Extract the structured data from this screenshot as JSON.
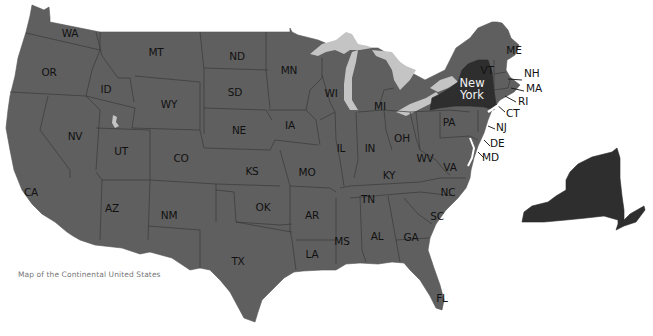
{
  "caption": "Map of the Continental United States",
  "colors": {
    "land": "#5f5f5f",
    "highlight_new_york": "#2e2e2e",
    "lakes": "#c4c4c4",
    "label_text": "#111111",
    "highlight_label_text": "#f2f2f2",
    "caption_text": "#777777",
    "background": "#ffffff"
  },
  "highlighted_state": {
    "line1": "New",
    "line2": "York"
  },
  "states": [
    {
      "abbr": "WA",
      "x": 70,
      "y": 33
    },
    {
      "abbr": "OR",
      "x": 49,
      "y": 72
    },
    {
      "abbr": "ID",
      "x": 106,
      "y": 89
    },
    {
      "abbr": "MT",
      "x": 156,
      "y": 52
    },
    {
      "abbr": "WY",
      "x": 169,
      "y": 104
    },
    {
      "abbr": "ND",
      "x": 237,
      "y": 56
    },
    {
      "abbr": "SD",
      "x": 235,
      "y": 92
    },
    {
      "abbr": "NE",
      "x": 239,
      "y": 130
    },
    {
      "abbr": "MN",
      "x": 289,
      "y": 70
    },
    {
      "abbr": "IA",
      "x": 290,
      "y": 125
    },
    {
      "abbr": "WI",
      "x": 331,
      "y": 93
    },
    {
      "abbr": "MI",
      "x": 380,
      "y": 106
    },
    {
      "abbr": "NV",
      "x": 75,
      "y": 136
    },
    {
      "abbr": "UT",
      "x": 121,
      "y": 151
    },
    {
      "abbr": "CO",
      "x": 181,
      "y": 158
    },
    {
      "abbr": "KS",
      "x": 252,
      "y": 171
    },
    {
      "abbr": "MO",
      "x": 307,
      "y": 172
    },
    {
      "abbr": "IL",
      "x": 341,
      "y": 148
    },
    {
      "abbr": "IN",
      "x": 370,
      "y": 148
    },
    {
      "abbr": "OH",
      "x": 402,
      "y": 138
    },
    {
      "abbr": "PA",
      "x": 449,
      "y": 122
    },
    {
      "abbr": "WV",
      "x": 425,
      "y": 158
    },
    {
      "abbr": "VA",
      "x": 450,
      "y": 167
    },
    {
      "abbr": "KY",
      "x": 389,
      "y": 175
    },
    {
      "abbr": "CA",
      "x": 31,
      "y": 192
    },
    {
      "abbr": "AZ",
      "x": 112,
      "y": 208
    },
    {
      "abbr": "NM",
      "x": 169,
      "y": 215
    },
    {
      "abbr": "OK",
      "x": 263,
      "y": 207
    },
    {
      "abbr": "AR",
      "x": 312,
      "y": 215
    },
    {
      "abbr": "TN",
      "x": 368,
      "y": 199
    },
    {
      "abbr": "NC",
      "x": 448,
      "y": 192
    },
    {
      "abbr": "SC",
      "x": 437,
      "y": 216
    },
    {
      "abbr": "GA",
      "x": 411,
      "y": 237
    },
    {
      "abbr": "AL",
      "x": 377,
      "y": 236
    },
    {
      "abbr": "MS",
      "x": 342,
      "y": 241
    },
    {
      "abbr": "LA",
      "x": 312,
      "y": 254
    },
    {
      "abbr": "TX",
      "x": 238,
      "y": 261
    },
    {
      "abbr": "FL",
      "x": 442,
      "y": 298
    },
    {
      "abbr": "ME",
      "x": 514,
      "y": 50
    },
    {
      "abbr": "VT",
      "x": 487,
      "y": 70
    }
  ],
  "callouts": [
    {
      "abbr": "NH",
      "x": 524,
      "y": 73
    },
    {
      "abbr": "MA",
      "x": 526,
      "y": 88
    },
    {
      "abbr": "RI",
      "x": 518,
      "y": 101
    },
    {
      "abbr": "CT",
      "x": 506,
      "y": 113
    },
    {
      "abbr": "NJ",
      "x": 496,
      "y": 127
    },
    {
      "abbr": "DE",
      "x": 490,
      "y": 143
    },
    {
      "abbr": "MD",
      "x": 482,
      "y": 157
    }
  ]
}
